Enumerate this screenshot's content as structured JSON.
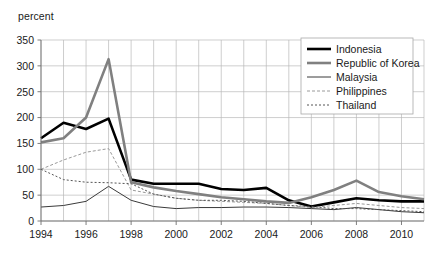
{
  "chart_data": {
    "type": "line",
    "title": "",
    "subtitle": "",
    "xlabel": "",
    "ylabel": "percent",
    "unit_label": "percent",
    "grid": true,
    "legend_position": "top-right",
    "xlim": [
      1994,
      2011
    ],
    "ylim": [
      0,
      350
    ],
    "yticks": [
      0,
      50,
      100,
      150,
      200,
      250,
      300,
      350
    ],
    "xticks": [
      1994,
      1996,
      1998,
      2000,
      2002,
      2004,
      2006,
      2008,
      2010
    ],
    "xtick_labels": [
      "1994",
      "1996",
      "1998",
      "2000",
      "2002",
      "2004",
      "2006",
      "2008",
      "2010"
    ],
    "ytick_labels": [
      "0",
      "50",
      "100",
      "150",
      "200",
      "250",
      "300",
      "350"
    ],
    "x": [
      1994,
      1995,
      1996,
      1997,
      1998,
      1999,
      2000,
      2001,
      2002,
      2003,
      2004,
      2005,
      2006,
      2007,
      2008,
      2009,
      2010,
      2011
    ],
    "series": [
      {
        "name": "Indonesia",
        "color": "#000000",
        "width": 2.6,
        "dash": "none",
        "values": [
          160,
          190,
          178,
          198,
          80,
          72,
          72,
          72,
          62,
          60,
          64,
          40,
          28,
          36,
          44,
          40,
          38,
          38
        ]
      },
      {
        "name": "Republic of Korea",
        "color": "#808080",
        "width": 2.6,
        "dash": "none",
        "values": [
          152,
          160,
          200,
          313,
          75,
          65,
          58,
          52,
          46,
          42,
          38,
          35,
          46,
          60,
          78,
          56,
          48,
          42
        ]
      },
      {
        "name": "Malaysia",
        "color": "#3a3a3a",
        "width": 1.0,
        "dash": "none",
        "values": [
          27,
          30,
          38,
          67,
          40,
          28,
          24,
          26,
          26,
          27,
          27,
          26,
          24,
          22,
          26,
          22,
          18,
          16
        ]
      },
      {
        "name": "Philippines",
        "color": "#9a9a9a",
        "width": 1.0,
        "dash": "3,2",
        "values": [
          100,
          118,
          133,
          140,
          60,
          52,
          44,
          40,
          38,
          36,
          34,
          30,
          26,
          30,
          34,
          30,
          26,
          24
        ]
      },
      {
        "name": "Thailand",
        "color": "#555555",
        "width": 1.0,
        "dash": "2,2",
        "values": [
          100,
          80,
          75,
          74,
          72,
          52,
          44,
          40,
          40,
          38,
          34,
          30,
          28,
          24,
          24,
          22,
          20,
          18
        ]
      }
    ]
  },
  "legend": {
    "entries": [
      {
        "label": "Indonesia"
      },
      {
        "label": "Republic of Korea"
      },
      {
        "label": "Malaysia"
      },
      {
        "label": "Philippines"
      },
      {
        "label": "Thailand"
      }
    ]
  }
}
